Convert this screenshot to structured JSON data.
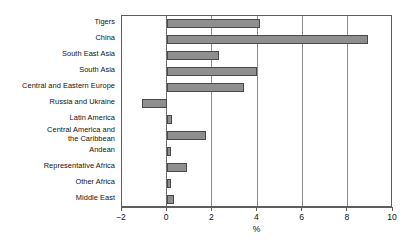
{
  "chart_data": {
    "type": "bar",
    "orientation": "horizontal",
    "title": "",
    "xlabel": "%",
    "ylabel": "",
    "xlim": [
      -2,
      10
    ],
    "xticks": [
      -2,
      0,
      2,
      4,
      6,
      8,
      10
    ],
    "xtick_labels": [
      "−2",
      "0",
      "2",
      "4",
      "6",
      "8",
      "10"
    ],
    "grid": true,
    "legend": false,
    "categories": [
      "Tigers",
      "China",
      "South East Asia",
      "South Asia",
      "Central and Eastern Europe",
      "Russia and Ukraine",
      "Latin America",
      "Central America and\nthe Caribbean",
      "Andean",
      "Representative Africa",
      "Other Africa",
      "Middle East"
    ],
    "values": [
      4.1,
      8.9,
      2.3,
      4.0,
      3.4,
      -1.1,
      0.2,
      1.7,
      0.15,
      0.9,
      0.15,
      0.3
    ],
    "bar_fill_color": "#8e8e8e",
    "bar_border_color": "#4a4a4a",
    "axis_color": "#5e5e5e",
    "grid_color": "#8c8c8c",
    "background_color": "#ffffff"
  }
}
